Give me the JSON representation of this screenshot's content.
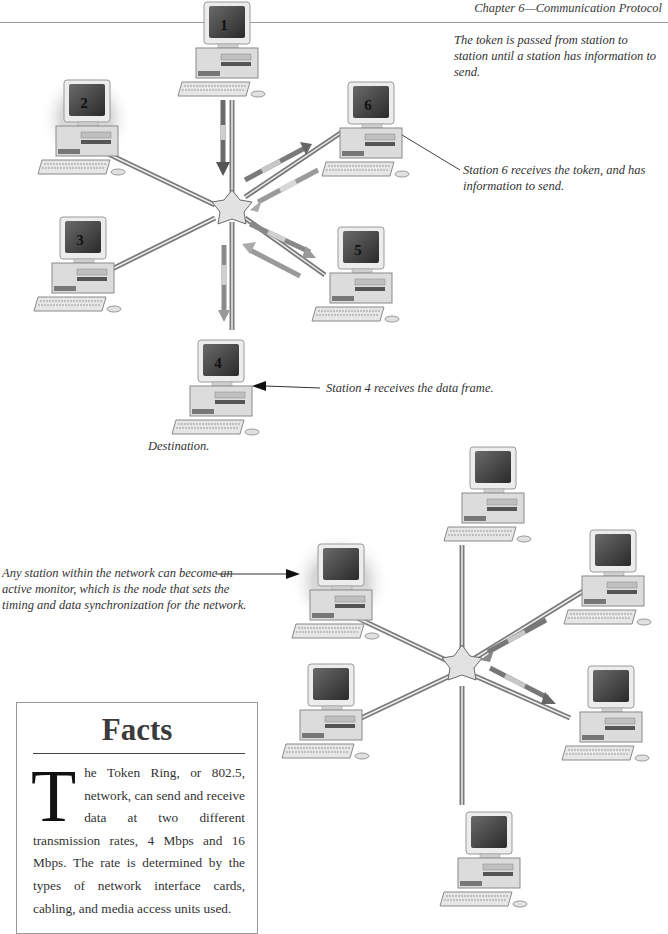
{
  "header": {
    "title": "Chapter 6—Communication Protocol"
  },
  "diagram_top": {
    "stations": [
      {
        "id": "1",
        "label": "1"
      },
      {
        "id": "2",
        "label": "2"
      },
      {
        "id": "3",
        "label": "3"
      },
      {
        "id": "4",
        "label": "4"
      },
      {
        "id": "5",
        "label": "5"
      },
      {
        "id": "6",
        "label": "6"
      }
    ],
    "captions": {
      "token_passed": "The token is passed from station to station until a station has information to send.",
      "station6": "Station 6 receives the token, and has information to send.",
      "station4": "Station 4 receives the data frame.",
      "destination": "Destination."
    }
  },
  "diagram_bottom": {
    "captions": {
      "active_monitor": "Any station within the network can become an active monitor, which is the node that sets the timing and data synchronization for the network."
    }
  },
  "facts": {
    "title": "Facts",
    "dropcap": "T",
    "body": "he Token Ring, or 802.5, network, can send and receive data at two different transmission rates, 4 Mbps and 16 Mbps. The rate is determined by the types of network interface cards, cabling, and media access units used."
  },
  "colors": {
    "cable": "#8a8a8a",
    "arrow_dark": "#555555",
    "arrow_light": "#b0b0b0",
    "text": "#333333"
  }
}
